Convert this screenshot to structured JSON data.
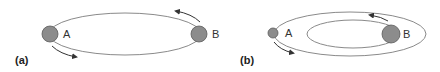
{
  "colors": {
    "orbit": "#8a8a8a",
    "ball_fill": "#8c8c8c",
    "ball_stroke": "#5a5a5a",
    "arrow": "#333333",
    "text": "#333333"
  },
  "panels": [
    {
      "id": "a",
      "label": "(a)",
      "body_a_label": "A",
      "body_b_label": "B",
      "description": "Two equal-mass bodies A and B orbiting on a shared elliptical path"
    },
    {
      "id": "b",
      "label": "(b)",
      "body_a_label": "A",
      "body_b_label": "B",
      "description": "Small body A on large outer orbit, larger body B on smaller inner orbit"
    }
  ]
}
